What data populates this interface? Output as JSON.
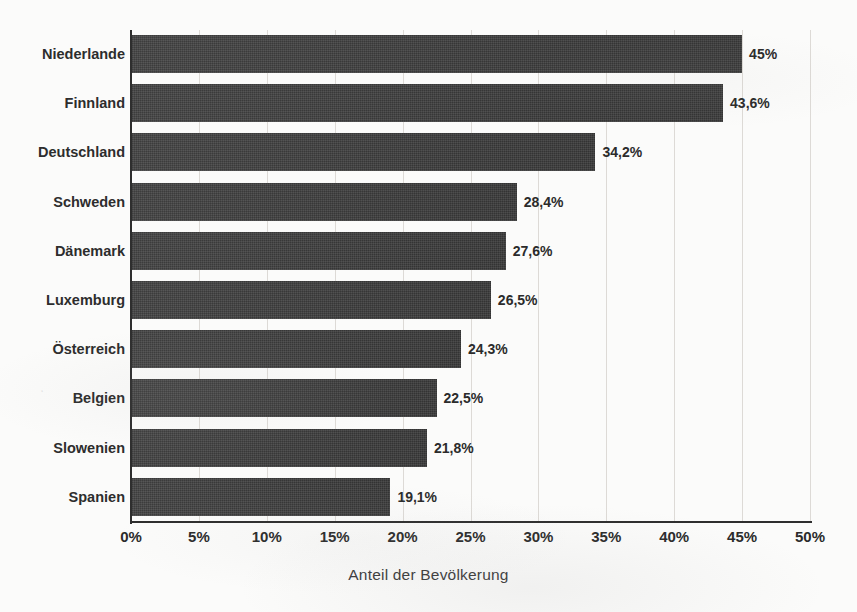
{
  "chart_data": {
    "type": "bar",
    "orientation": "horizontal",
    "title": "",
    "xlabel": "Anteil der Bevölkerung",
    "ylabel": "",
    "xlim": [
      0,
      50
    ],
    "xtick_labels": [
      "0%",
      "5%",
      "10%",
      "15%",
      "20%",
      "25%",
      "30%",
      "35%",
      "40%",
      "45%",
      "50%"
    ],
    "xticks": [
      0,
      5,
      10,
      15,
      20,
      25,
      30,
      35,
      40,
      45,
      50
    ],
    "grid": "vertical-only",
    "legend": "none",
    "bar_color": "#3b3b3b",
    "categories": [
      "Niederlande",
      "Finnland",
      "Deutschland",
      "Schweden",
      "Dänemark",
      "Luxemburg",
      "Österreich",
      "Belgien",
      "Slowenien",
      "Spanien"
    ],
    "values": [
      45,
      43.6,
      34.2,
      28.4,
      27.6,
      26.5,
      24.3,
      22.5,
      21.8,
      19.1
    ],
    "value_labels": [
      "45%",
      "43,6%",
      "34,2%",
      "28,4%",
      "27,6%",
      "26,5%",
      "24,3%",
      "22,5%",
      "21,8%",
      "19,1%"
    ],
    "bars": [
      {
        "category": "Niederlande",
        "value": 45,
        "label": "45%"
      },
      {
        "category": "Finnland",
        "value": 43.6,
        "label": "43,6%"
      },
      {
        "category": "Deutschland",
        "value": 34.2,
        "label": "34,2%"
      },
      {
        "category": "Schweden",
        "value": 28.4,
        "label": "28,4%"
      },
      {
        "category": "Dänemark",
        "value": 27.6,
        "label": "27,6%"
      },
      {
        "category": "Luxemburg",
        "value": 26.5,
        "label": "26,5%"
      },
      {
        "category": "Österreich",
        "value": 24.3,
        "label": "24,3%"
      },
      {
        "category": "Belgien",
        "value": 22.5,
        "label": "22,5%"
      },
      {
        "category": "Slowenien",
        "value": 21.8,
        "label": "21,8%"
      },
      {
        "category": "Spanien",
        "value": 19.1,
        "label": "19,1%"
      }
    ]
  }
}
